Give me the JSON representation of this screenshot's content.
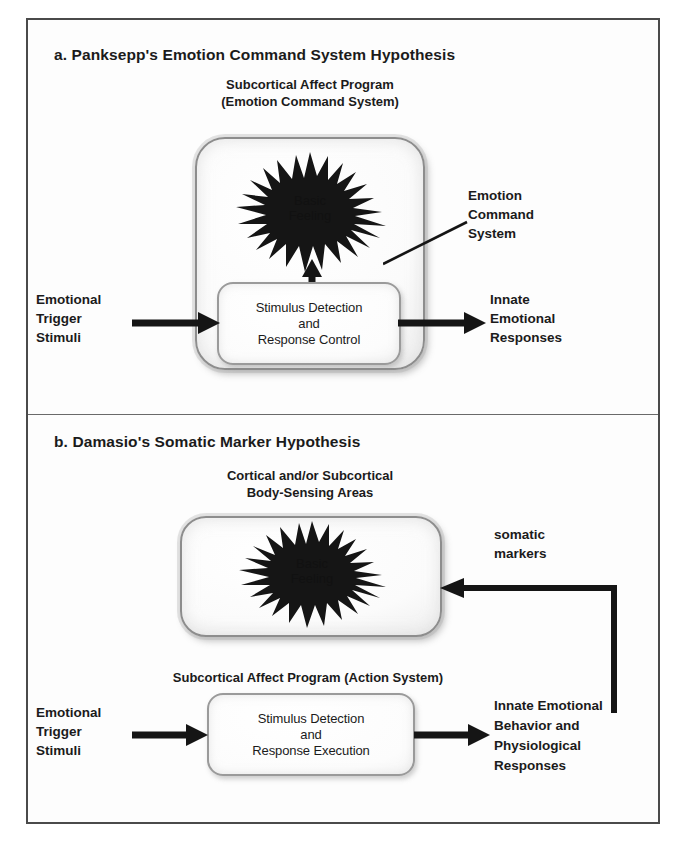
{
  "figure": {
    "panel_a": {
      "title": "a. Panksepp's Emotion Command System Hypothesis",
      "box_caption": "Subcortical Affect Program\n(Emotion Command System)",
      "burst_label": "Basic\nFeeling",
      "inner_box_text": "Stimulus Detection\nand\nResponse Control",
      "left_label": "Emotional\nTrigger\nStimuli",
      "right_label": "Innate\nEmotional\nResponses",
      "callout_label": "Emotion\nCommand\nSystem"
    },
    "panel_b": {
      "title": "b. Damasio's Somatic Marker Hypothesis",
      "box_caption": "Cortical and/or Subcortical\nBody-Sensing Areas",
      "burst_label": "Basic\nFeeling",
      "program_caption": "Subcortical Affect Program (Action System)",
      "inner_box_text": "Stimulus Detection\nand\nResponse Execution",
      "left_label": "Emotional\nTrigger\nStimuli",
      "right_label": "Innate Emotional\nBehavior and\nPhysiological\nResponses",
      "feedback_label": "somatic\nmarkers"
    },
    "colors": {
      "ink": "#1b1b1b",
      "frame": "#4a4a4a",
      "box_border": "#8d8d8d",
      "page": "#ffffff"
    }
  }
}
